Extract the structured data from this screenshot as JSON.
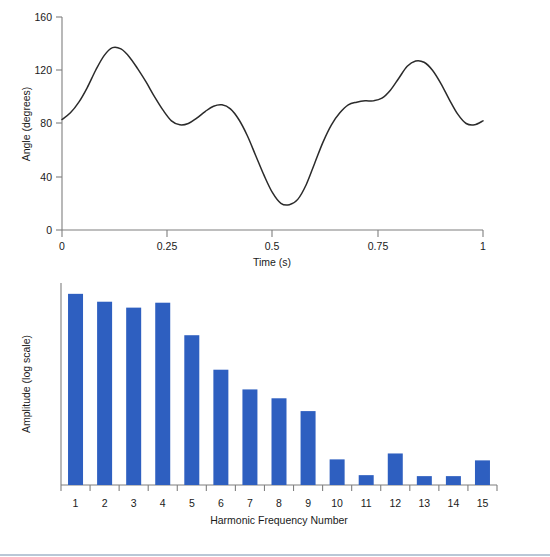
{
  "colors": {
    "bar_blue": "#2E5FC0",
    "axis_gray": "#7f7f7f",
    "curve_black": "#2b2b2b",
    "rule_blue": "#b9c7d6"
  },
  "chart_data": [
    {
      "id": "angle-vs-time",
      "type": "line",
      "title": "",
      "xlabel": "Time (s)",
      "ylabel": "Angle (degrees)",
      "xlim": [
        0,
        1
      ],
      "ylim": [
        0,
        160
      ],
      "xticks": [
        0,
        0.25,
        0.5,
        0.75,
        1
      ],
      "xticklabels": [
        "0",
        "0.25",
        "0.5",
        "0.75",
        "1"
      ],
      "yticks": [
        0,
        40,
        80,
        120,
        160
      ],
      "yticklabels": [
        "0",
        "40",
        "80",
        "120",
        "160"
      ],
      "grid": false,
      "legend": "none",
      "series": [
        {
          "name": "Angle",
          "x": [
            0.0,
            0.02,
            0.04,
            0.06,
            0.08,
            0.1,
            0.12,
            0.14,
            0.16,
            0.18,
            0.2,
            0.22,
            0.24,
            0.26,
            0.28,
            0.3,
            0.32,
            0.34,
            0.36,
            0.38,
            0.4,
            0.42,
            0.44,
            0.46,
            0.48,
            0.5,
            0.52,
            0.54,
            0.56,
            0.58,
            0.6,
            0.62,
            0.64,
            0.66,
            0.68,
            0.7,
            0.72,
            0.74,
            0.76,
            0.78,
            0.8,
            0.82,
            0.84,
            0.86,
            0.88,
            0.9,
            0.92,
            0.94,
            0.96,
            0.98,
            1.0
          ],
          "y": [
            83,
            88,
            96,
            107,
            120,
            131,
            137,
            136,
            130,
            121,
            111,
            100,
            90,
            82,
            79,
            80,
            84,
            89,
            93,
            94,
            91,
            83,
            71,
            56,
            41,
            28,
            20,
            19,
            23,
            34,
            50,
            66,
            79,
            88,
            94,
            96,
            97,
            97,
            99,
            105,
            114,
            123,
            127,
            126,
            120,
            110,
            98,
            87,
            80,
            79,
            82
          ]
        }
      ]
    },
    {
      "id": "harmonic-spectrum",
      "type": "bar",
      "title": "",
      "xlabel": "Harmonic Frequency Number",
      "ylabel": "Amplitude (log scale)",
      "grid": false,
      "legend": "none",
      "yticks": [],
      "yticklabels": [],
      "categories": [
        "1",
        "2",
        "3",
        "4",
        "5",
        "6",
        "7",
        "8",
        "9",
        "10",
        "11",
        "12",
        "13",
        "14",
        "15"
      ],
      "values": [
        194,
        186,
        180,
        185,
        152,
        117,
        97,
        88,
        75,
        26,
        10,
        32,
        9,
        9,
        25
      ],
      "value_units": "relative bar height (log amplitude, unlabeled axis)",
      "ymax": 205,
      "bar_color": "#2E5FC0"
    }
  ]
}
